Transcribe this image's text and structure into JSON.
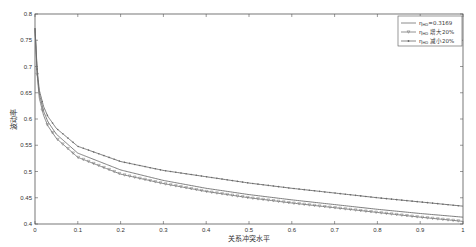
{
  "chart_data": {
    "type": "line",
    "title": "",
    "xlabel": "关系冲突水平",
    "ylabel": "波动率",
    "xlim": [
      0,
      1
    ],
    "ylim": [
      0.4,
      0.8
    ],
    "xticks": [
      0,
      0.1,
      0.2,
      0.3,
      0.4,
      0.5,
      0.6,
      0.7,
      0.8,
      0.9,
      1
    ],
    "xtick_labels": [
      "0",
      "0.1",
      "0.2",
      "0.3",
      "0.4",
      "0.5",
      "0.6",
      "0.7",
      "0.8",
      "0.9",
      "1"
    ],
    "yticks": [
      0.4,
      0.45,
      0.5,
      0.55,
      0.6,
      0.65,
      0.7,
      0.75,
      0.8
    ],
    "ytick_labels": [
      "0.4",
      "0.45",
      "0.5",
      "0.55",
      "0.6",
      "0.65",
      "0.7",
      "0.75",
      "0.8"
    ],
    "grid": false,
    "legend_position": "top-right",
    "x": [
      0,
      0.005,
      0.01,
      0.02,
      0.03,
      0.05,
      0.1,
      0.2,
      0.3,
      0.4,
      0.5,
      0.6,
      0.7,
      0.8,
      0.9,
      1.0
    ],
    "series": [
      {
        "name": "η_HD=0.3169",
        "legend_main": "η",
        "legend_sub": "HD",
        "legend_suffix": "=0.3169",
        "marker": "none",
        "values": [
          0.773,
          0.69,
          0.648,
          0.615,
          0.595,
          0.571,
          0.535,
          0.503,
          0.483,
          0.468,
          0.456,
          0.446,
          0.437,
          0.428,
          0.42,
          0.413
        ]
      },
      {
        "name": "η_HD 增大20%",
        "legend_main": "η",
        "legend_sub": "HD",
        "legend_suffix": " 增大20%",
        "marker": "triangle",
        "values": [
          0.773,
          0.685,
          0.64,
          0.607,
          0.587,
          0.563,
          0.527,
          0.495,
          0.477,
          0.462,
          0.45,
          0.44,
          0.431,
          0.422,
          0.413,
          0.405
        ]
      },
      {
        "name": "η_HD 减小20%",
        "legend_main": "η",
        "legend_sub": "HD",
        "legend_suffix": " 减小20%",
        "marker": "dot",
        "values": [
          0.773,
          0.695,
          0.655,
          0.624,
          0.605,
          0.582,
          0.548,
          0.519,
          0.502,
          0.49,
          0.478,
          0.468,
          0.459,
          0.45,
          0.442,
          0.434
        ]
      }
    ]
  }
}
